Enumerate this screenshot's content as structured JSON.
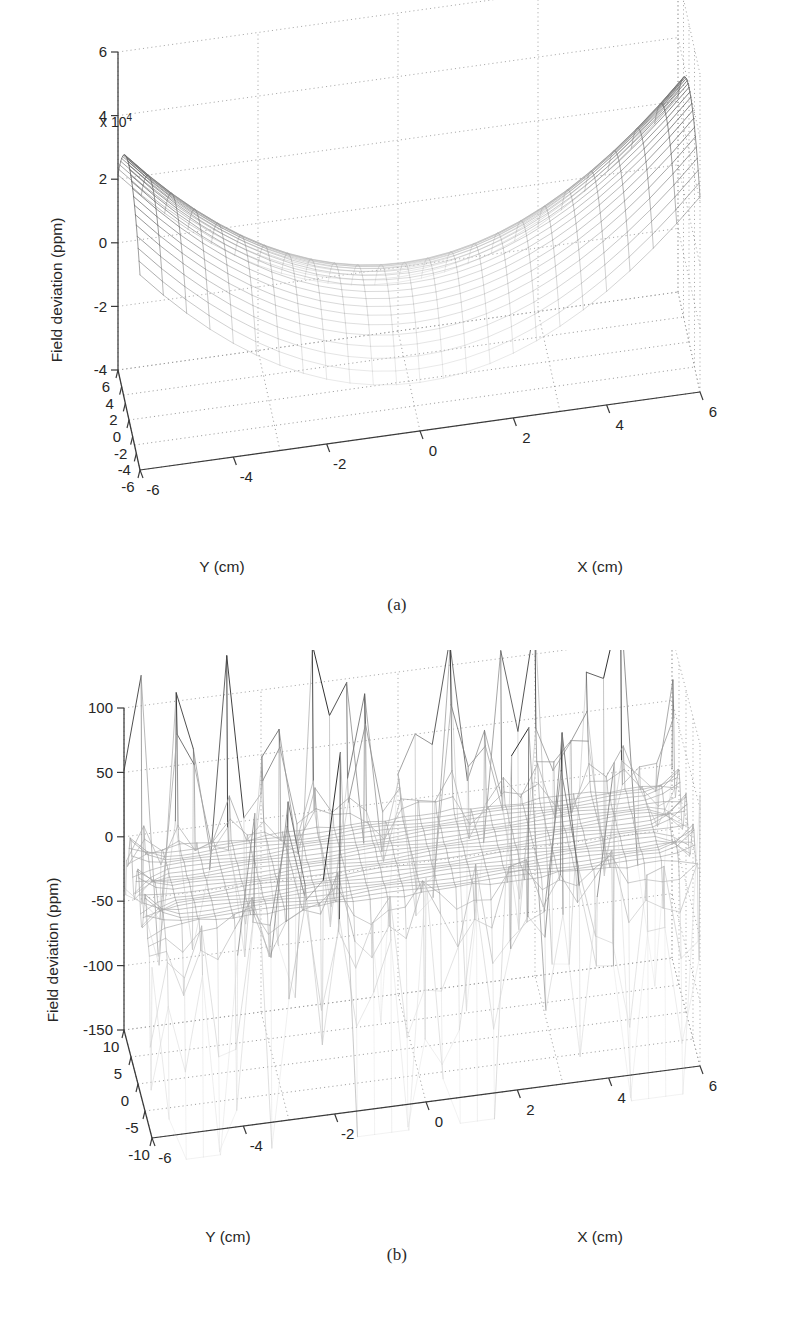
{
  "figure": {
    "panels": [
      {
        "id": "a",
        "caption": "(a)",
        "zaxis": {
          "label": "Field deviation (ppm)",
          "exponent_prefix": "x 10",
          "exponent_power": "4",
          "ticks": [
            "6",
            "4",
            "2",
            "0",
            "-2",
            "-4"
          ],
          "tick_values": [
            6,
            4,
            2,
            0,
            -2,
            -4
          ],
          "range": [
            -4,
            6
          ],
          "scale": 10000
        },
        "yaxis": {
          "label": "Y (cm)",
          "ticks": [
            "6",
            "4",
            "2",
            "0",
            "-2",
            "-4",
            "-6"
          ],
          "tick_values": [
            6,
            4,
            2,
            0,
            -2,
            -4,
            -6
          ],
          "range": [
            -6,
            6
          ]
        },
        "xaxis": {
          "label": "X (cm)",
          "ticks": [
            "-6",
            "-4",
            "-2",
            "0",
            "2",
            "4",
            "6"
          ],
          "tick_values": [
            -6,
            -4,
            -2,
            0,
            2,
            4,
            6
          ],
          "range": [
            -6,
            6
          ]
        }
      },
      {
        "id": "b",
        "caption": "(b)",
        "zaxis": {
          "label": "Field deviation (ppm)",
          "exponent_prefix": "",
          "exponent_power": "",
          "ticks": [
            "100",
            "50",
            "0",
            "-50",
            "-100",
            "-150"
          ],
          "tick_values": [
            100,
            50,
            0,
            -50,
            -100,
            -150
          ],
          "range": [
            -150,
            100
          ],
          "scale": 1
        },
        "yaxis": {
          "label": "Y (cm)",
          "ticks": [
            "10",
            "5",
            "0",
            "-5",
            "-10"
          ],
          "tick_values": [
            10,
            5,
            0,
            -5,
            -10
          ],
          "range": [
            -10,
            10
          ]
        },
        "xaxis": {
          "label": "X (cm)",
          "ticks": [
            "-6",
            "-4",
            "-2",
            "0",
            "2",
            "4",
            "6"
          ],
          "tick_values": [
            -6,
            -4,
            -2,
            0,
            2,
            4,
            6
          ],
          "range": [
            -6,
            6
          ]
        }
      }
    ]
  },
  "chart_data": [
    {
      "type": "surface",
      "panel": "a",
      "title": "",
      "xlabel": "X (cm)",
      "ylabel": "Y (cm)",
      "zlabel": "Field deviation (ppm)",
      "xlim": [
        -6,
        6
      ],
      "ylim": [
        -6,
        6
      ],
      "zlim": [
        -40000,
        60000
      ],
      "z_tick_scale": 10000,
      "grid": true,
      "legend": "none",
      "mesh": {
        "nx": 25,
        "ny": 25,
        "style": "wireframe-grayscale"
      },
      "description": "Saddle-shaped quadrupolar field deviation: two opposing positive peaks near (x=+6,y=+6) and (x=-6,y=-6) rising to about +6e4 ppm, deep negative valley along the opposite diagonal falling to about -4e4 ppm, near-zero at the centre.",
      "surface_model": {
        "form": "a*(x*x - y*y) + b*(x*x + y*y) + c",
        "a": 900.0,
        "b": 380.0,
        "c": -6000.0,
        "note": "approximate analytic fit used to regenerate the mesh in ppm"
      },
      "annotations": [
        {
          "text": "x 10^4",
          "position": "above-z-axis",
          "meaning": "z tick multiplier"
        }
      ]
    },
    {
      "type": "surface",
      "panel": "b",
      "title": "",
      "xlabel": "X (cm)",
      "ylabel": "Y (cm)",
      "zlabel": "Field deviation (ppm)",
      "xlim": [
        -6,
        6
      ],
      "ylim": [
        -10,
        10
      ],
      "zlim": [
        -150,
        100
      ],
      "z_tick_scale": 1,
      "grid": true,
      "legend": "none",
      "mesh": {
        "nx": 33,
        "ny": 33,
        "style": "wireframe-grayscale"
      },
      "description": "Shimmed/corrected field: flat plateau near 0 ppm over the central region with sharp residual spikes at the Y extremes reaching about +100 ppm upward and -150 ppm downward at the corners and edges.",
      "surface_model": {
        "form": "plateau + edge_spikes",
        "plateau_value": 0,
        "plateau_ripple_amplitude": 4,
        "spike_positive_max": 100,
        "spike_negative_max": -150,
        "spike_edge_onset_abs_y": 6.5
      },
      "annotations": []
    }
  ]
}
